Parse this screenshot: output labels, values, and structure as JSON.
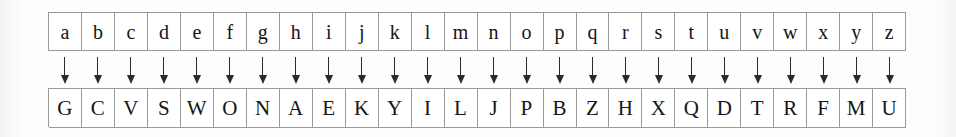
{
  "figure": {
    "kind": "substitution-cipher-table",
    "columns": 26,
    "arrow_icon": "down-arrow-icon",
    "colors": {
      "page_background": "#fdfdfc",
      "cell_background": "#ffffff",
      "cell_border": "#9a9a9a",
      "text": "#151515",
      "arrow": "#2b2b2b"
    }
  },
  "plaintext_row": {
    "label": "plaintext-alphabet",
    "letters": [
      "a",
      "b",
      "c",
      "d",
      "e",
      "f",
      "g",
      "h",
      "i",
      "j",
      "k",
      "l",
      "m",
      "n",
      "o",
      "p",
      "q",
      "r",
      "s",
      "t",
      "u",
      "v",
      "w",
      "x",
      "y",
      "z"
    ]
  },
  "arrow_row": {
    "label": "maps-to-arrows",
    "glyph": "↓",
    "count": 26
  },
  "ciphertext_row": {
    "label": "ciphertext-alphabet",
    "letters": [
      "G",
      "C",
      "V",
      "S",
      "W",
      "O",
      "N",
      "A",
      "E",
      "K",
      "Y",
      "I",
      "L",
      "J",
      "P",
      "B",
      "Z",
      "H",
      "X",
      "Q",
      "D",
      "T",
      "R",
      "F",
      "M",
      "U"
    ]
  },
  "mapping": [
    {
      "from": "a",
      "to": "G"
    },
    {
      "from": "b",
      "to": "C"
    },
    {
      "from": "c",
      "to": "V"
    },
    {
      "from": "d",
      "to": "S"
    },
    {
      "from": "e",
      "to": "W"
    },
    {
      "from": "f",
      "to": "O"
    },
    {
      "from": "g",
      "to": "N"
    },
    {
      "from": "h",
      "to": "A"
    },
    {
      "from": "i",
      "to": "E"
    },
    {
      "from": "j",
      "to": "K"
    },
    {
      "from": "k",
      "to": "Y"
    },
    {
      "from": "l",
      "to": "I"
    },
    {
      "from": "m",
      "to": "L"
    },
    {
      "from": "n",
      "to": "J"
    },
    {
      "from": "o",
      "to": "P"
    },
    {
      "from": "p",
      "to": "B"
    },
    {
      "from": "q",
      "to": "Z"
    },
    {
      "from": "r",
      "to": "H"
    },
    {
      "from": "s",
      "to": "X"
    },
    {
      "from": "t",
      "to": "Q"
    },
    {
      "from": "u",
      "to": "D"
    },
    {
      "from": "v",
      "to": "T"
    },
    {
      "from": "w",
      "to": "R"
    },
    {
      "from": "x",
      "to": "F"
    },
    {
      "from": "y",
      "to": "M"
    },
    {
      "from": "z",
      "to": "U"
    }
  ]
}
